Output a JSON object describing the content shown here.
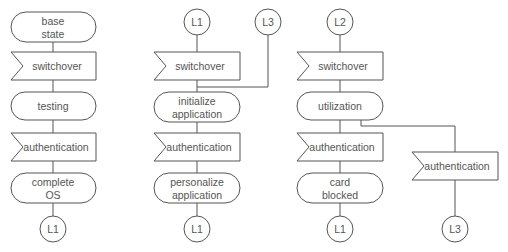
{
  "diagram": {
    "type": "SDL state flow",
    "columns": [
      {
        "id": "col1",
        "nodes": [
          {
            "kind": "state",
            "line1": "base",
            "line2": "state"
          },
          {
            "kind": "input",
            "label": "switchover"
          },
          {
            "kind": "state",
            "label": "testing"
          },
          {
            "kind": "input",
            "label": "authentication"
          },
          {
            "kind": "state",
            "line1": "complete",
            "line2": "OS"
          },
          {
            "kind": "connector",
            "label": "L1"
          }
        ]
      },
      {
        "id": "col2",
        "entry_connectors": [
          {
            "label": "L1"
          },
          {
            "label": "L3"
          }
        ],
        "nodes": [
          {
            "kind": "input",
            "label": "switchover"
          },
          {
            "kind": "state",
            "line1": "initialize",
            "line2": "application"
          },
          {
            "kind": "input",
            "label": "authentication"
          },
          {
            "kind": "state",
            "line1": "personalize",
            "line2": "application"
          },
          {
            "kind": "connector",
            "label": "L1"
          }
        ]
      },
      {
        "id": "col3",
        "entry_connectors": [
          {
            "label": "L2"
          }
        ],
        "nodes": [
          {
            "kind": "input",
            "label": "switchover"
          },
          {
            "kind": "state",
            "label": "utilization"
          },
          {
            "kind": "input",
            "label": "authentication"
          },
          {
            "kind": "state",
            "line1": "card",
            "line2": "blocked"
          },
          {
            "kind": "connector",
            "label": "L1"
          }
        ],
        "branch": [
          {
            "kind": "input",
            "label": "authentication"
          },
          {
            "kind": "connector",
            "label": "L3"
          }
        ]
      }
    ]
  },
  "colors": {
    "stroke": "#555555",
    "text": "#555555",
    "background": "#ffffff"
  }
}
